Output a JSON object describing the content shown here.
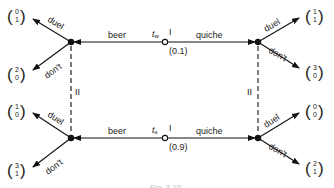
{
  "diagram": {
    "type": "signaling game tree (beer-quiche)",
    "caption": "Fig. 3.10",
    "nature_nodes": [
      {
        "id": "tw",
        "type_label": "t",
        "subscript": "w",
        "player": "I",
        "probability": "(0.1)"
      },
      {
        "id": "ts",
        "type_label": "t",
        "subscript": "s",
        "player": "I",
        "probability": "(0.9)"
      }
    ],
    "actions": {
      "left": "beer",
      "right": "quiche",
      "response_up": "duel",
      "response_down": "don't"
    },
    "info_set_label": "II",
    "payoffs": {
      "top_left_duel": [
        "0",
        "1"
      ],
      "top_left_dont": [
        "2",
        "0"
      ],
      "top_right_duel": [
        "1",
        "1"
      ],
      "top_right_dont": [
        "3",
        "0"
      ],
      "bottom_left_duel": [
        "1",
        "0"
      ],
      "bottom_left_dont": [
        "3",
        "1"
      ],
      "bottom_right_duel": [
        "0",
        "0"
      ],
      "bottom_right_dont": [
        "2",
        "1"
      ]
    }
  }
}
